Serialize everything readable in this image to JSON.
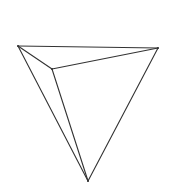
{
  "figure": {
    "kind": "3d-polyhedron-line-drawing",
    "background_color": "#ffffff",
    "stroke_color": "#333333",
    "stroke_width": 1.1,
    "canvas": {
      "width": 178,
      "height": 186
    },
    "vertices": [
      {
        "name": "top-left-vertex",
        "label": "A",
        "x": 18,
        "y": 46
      },
      {
        "name": "top-right-vertex",
        "label": "B",
        "x": 158,
        "y": 48
      },
      {
        "name": "bottom-vertex",
        "label": "C",
        "x": 88,
        "y": 181
      },
      {
        "name": "interior-vertex",
        "label": "D",
        "x": 52,
        "y": 69
      }
    ],
    "edges": [
      {
        "name": "edge-top",
        "from": "A",
        "to": "B",
        "hidden": false
      },
      {
        "name": "edge-left-outer",
        "from": "A",
        "to": "C",
        "hidden": false
      },
      {
        "name": "edge-right-outer",
        "from": "B",
        "to": "C",
        "hidden": false
      },
      {
        "name": "edge-front-left",
        "from": "A",
        "to": "D",
        "hidden": false
      },
      {
        "name": "edge-front-right",
        "from": "B",
        "to": "D",
        "hidden": false
      },
      {
        "name": "edge-front-bottom",
        "from": "D",
        "to": "C",
        "hidden": false
      }
    ],
    "faces": [
      {
        "name": "face-upper-left",
        "vertices": [
          "A",
          "B",
          "D"
        ]
      },
      {
        "name": "face-lower-left",
        "vertices": [
          "A",
          "D",
          "C"
        ]
      },
      {
        "name": "face-lower-right",
        "vertices": [
          "B",
          "D",
          "C"
        ]
      },
      {
        "name": "face-back",
        "vertices": [
          "A",
          "B",
          "C"
        ]
      }
    ]
  }
}
